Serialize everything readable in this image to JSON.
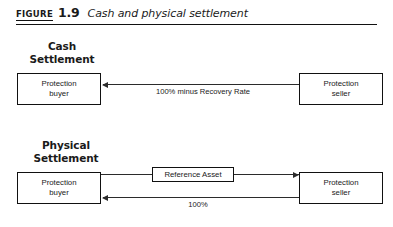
{
  "figure": {
    "label": "FIGURE",
    "number": "1.9",
    "title": "Cash and physical settlement"
  },
  "sections": {
    "cash": {
      "heading": "Cash\nSettlement",
      "heading_line1": "Cash",
      "heading_line2": "Settlement",
      "buyer": {
        "line1": "Protection",
        "line2": "buyer"
      },
      "seller": {
        "line1": "Protection",
        "line2": "seller"
      },
      "flow_label": "100% minus Recovery Rate"
    },
    "physical": {
      "heading_line1": "Physical",
      "heading_line2": "Settlement",
      "buyer": {
        "line1": "Protection",
        "line2": "buyer"
      },
      "seller": {
        "line1": "Protection",
        "line2": "seller"
      },
      "reference_asset": "Reference Asset",
      "payment_label": "100%"
    }
  },
  "colors": {
    "ink": "#111111",
    "line": "#2b2b2b",
    "background": "#ffffff"
  }
}
